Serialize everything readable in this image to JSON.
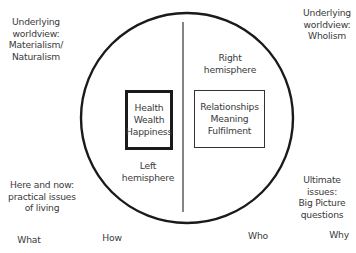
{
  "diagram": {
    "corners": {
      "top_left": {
        "lines": [
          "Underlying",
          "worldview:",
          "Materialism/",
          "Naturalism"
        ]
      },
      "top_right": {
        "lines": [
          "Underlying",
          "worldview:",
          "Wholism"
        ]
      },
      "bottom_left": {
        "lines": [
          "Here and now:",
          "practical issues",
          "of living"
        ]
      },
      "bottom_right": {
        "lines": [
          "Ultimate",
          "issues:",
          "Big Picture",
          "questions"
        ]
      }
    },
    "circle": {
      "left_half": {
        "label": {
          "lines": [
            "Left",
            "hemisphere"
          ]
        },
        "box": {
          "lines": [
            "Health",
            "Wealth",
            "Happiness"
          ]
        }
      },
      "right_half": {
        "label": {
          "lines": [
            "Right",
            "hemisphere"
          ]
        },
        "box": {
          "lines": [
            "Relationships",
            "Meaning",
            "Fulfilment"
          ]
        }
      }
    },
    "bottom_words": [
      "What",
      "How",
      "Who",
      "Why"
    ],
    "colors": {
      "stroke": "#1a1a1a",
      "text": "#3a3a3a",
      "background": "#ffffff"
    }
  }
}
